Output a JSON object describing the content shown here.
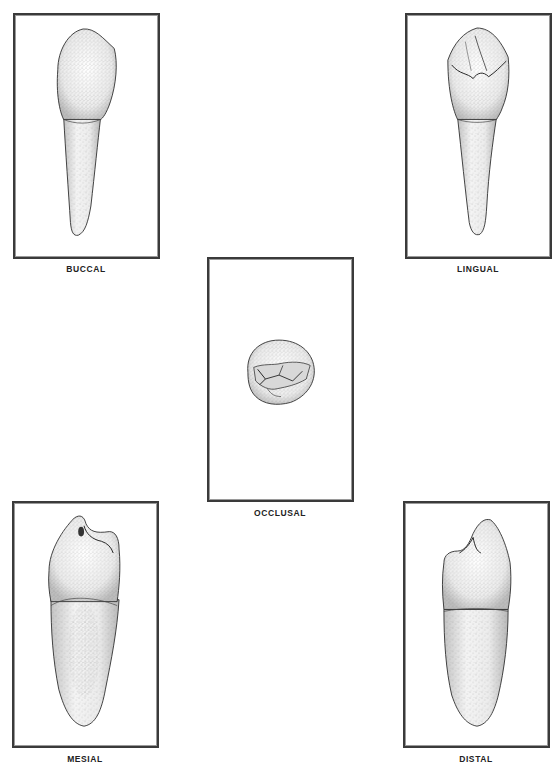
{
  "figure": {
    "views": [
      {
        "id": "buccal",
        "label": "BUCCAL"
      },
      {
        "id": "lingual",
        "label": "LINGUAL"
      },
      {
        "id": "occlusal",
        "label": "OCCLUSAL"
      },
      {
        "id": "mesial",
        "label": "MESIAL"
      },
      {
        "id": "distal",
        "label": "DISTAL"
      }
    ]
  },
  "colors": {
    "frame": "#3a3a3a",
    "ink": "#2a2a2a",
    "stipple": "#8a8a8a",
    "background": "#ffffff"
  }
}
